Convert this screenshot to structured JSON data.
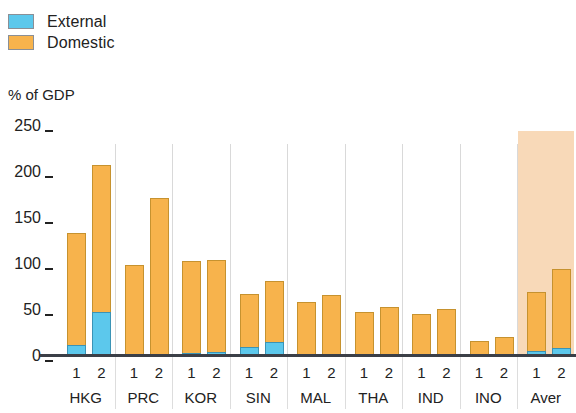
{
  "legend": {
    "position": "top-left",
    "items": [
      {
        "label": "External",
        "color": "#5cc8ec",
        "key": "external"
      },
      {
        "label": "Domestic",
        "color": "#f7b34c",
        "key": "domestic"
      }
    ]
  },
  "axis": {
    "ylabel": "% of GDP",
    "yticks": [
      "250",
      "200",
      "150",
      "100",
      "50",
      "0"
    ],
    "ymin": 0,
    "ymax": 250
  },
  "highlight": {
    "group": "Aver",
    "color": "#f8d9b8",
    "top_value": 245
  },
  "chart_data": {
    "type": "bar",
    "title": "",
    "subtitle": "",
    "xlabel": "",
    "ylabel": "% of GDP",
    "ylim": [
      0,
      250
    ],
    "yticks": [
      0,
      50,
      100,
      150,
      200,
      250
    ],
    "grid": false,
    "stacked": true,
    "legend_position": "top-left",
    "legend": [
      "External",
      "Domestic"
    ],
    "colors": {
      "external": "#5cc8ec",
      "domestic": "#f7b34c"
    },
    "groups": [
      "HKG",
      "PRC",
      "KOR",
      "SIN",
      "MAL",
      "THA",
      "IND",
      "INO",
      "Aver"
    ],
    "subcategories": [
      "1",
      "2"
    ],
    "series": [
      {
        "name": "External",
        "values": [
          12,
          48,
          1,
          2,
          3,
          4,
          10,
          15,
          1,
          2,
          1,
          1,
          1,
          2,
          1,
          2,
          5,
          9
        ]
      },
      {
        "name": "Domestic",
        "values": [
          122,
          160,
          97,
          170,
          100,
          100,
          57,
          67,
          57,
          64,
          46,
          51,
          44,
          49,
          14,
          18,
          65,
          86
        ]
      }
    ],
    "totals": [
      134,
      208,
      98,
      172,
      103,
      104,
      67,
      82,
      58,
      66,
      47,
      52,
      45,
      51,
      15,
      20,
      70,
      95
    ],
    "bars": [
      {
        "group": "HKG",
        "sub": "1",
        "external": 12,
        "domestic": 122,
        "total": 134
      },
      {
        "group": "HKG",
        "sub": "2",
        "external": 48,
        "domestic": 160,
        "total": 208
      },
      {
        "group": "PRC",
        "sub": "1",
        "external": 1,
        "domestic": 97,
        "total": 98
      },
      {
        "group": "PRC",
        "sub": "2",
        "external": 2,
        "domestic": 170,
        "total": 172
      },
      {
        "group": "KOR",
        "sub": "1",
        "external": 3,
        "domestic": 100,
        "total": 103
      },
      {
        "group": "KOR",
        "sub": "2",
        "external": 4,
        "domestic": 100,
        "total": 104
      },
      {
        "group": "SIN",
        "sub": "1",
        "external": 10,
        "domestic": 57,
        "total": 67
      },
      {
        "group": "SIN",
        "sub": "2",
        "external": 15,
        "domestic": 67,
        "total": 82
      },
      {
        "group": "MAL",
        "sub": "1",
        "external": 1,
        "domestic": 57,
        "total": 58
      },
      {
        "group": "MAL",
        "sub": "2",
        "external": 2,
        "domestic": 64,
        "total": 66
      },
      {
        "group": "THA",
        "sub": "1",
        "external": 1,
        "domestic": 46,
        "total": 47
      },
      {
        "group": "THA",
        "sub": "2",
        "external": 1,
        "domestic": 51,
        "total": 52
      },
      {
        "group": "IND",
        "sub": "1",
        "external": 1,
        "domestic": 44,
        "total": 45
      },
      {
        "group": "IND",
        "sub": "2",
        "external": 2,
        "domestic": 49,
        "total": 51
      },
      {
        "group": "INO",
        "sub": "1",
        "external": 1,
        "domestic": 14,
        "total": 15
      },
      {
        "group": "INO",
        "sub": "2",
        "external": 2,
        "domestic": 18,
        "total": 20
      },
      {
        "group": "Aver",
        "sub": "1",
        "external": 5,
        "domestic": 65,
        "total": 70
      },
      {
        "group": "Aver",
        "sub": "2",
        "external": 9,
        "domestic": 86,
        "total": 95
      }
    ]
  }
}
